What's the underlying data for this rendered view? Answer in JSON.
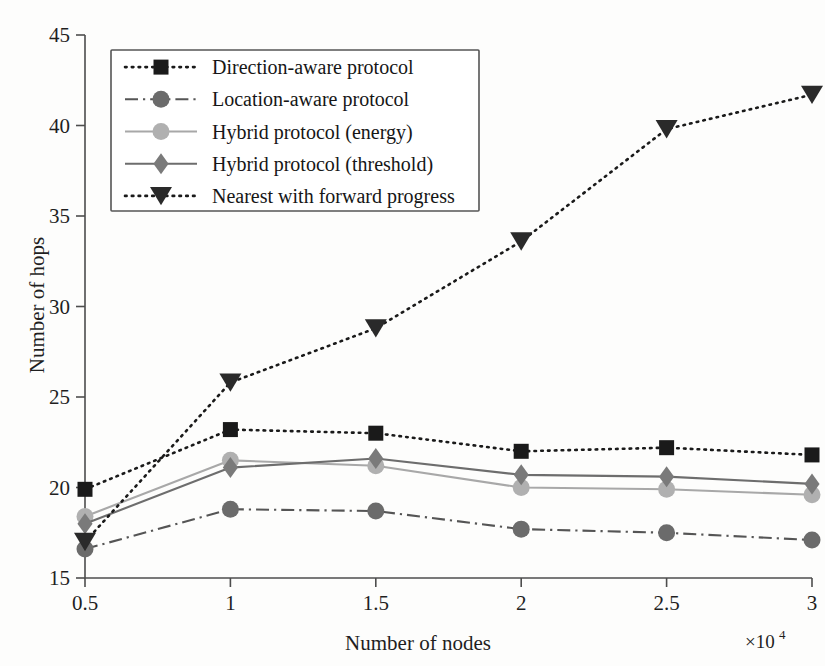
{
  "chart_data": {
    "type": "line",
    "title": "",
    "subtitle": "",
    "xlabel": "Number of nodes",
    "ylabel": "Number of hops",
    "x_multiplier": "×10⁴",
    "x_multiplier_base": "×10",
    "x_multiplier_exp": "4",
    "x": [
      0.5,
      1,
      1.5,
      2,
      2.5,
      3
    ],
    "xticklabels": [
      "0.5",
      "1",
      "1.5",
      "2",
      "2.5",
      "3"
    ],
    "yticks": [
      15,
      20,
      25,
      30,
      35,
      40,
      45
    ],
    "yticklabels": [
      "15",
      "20",
      "25",
      "30",
      "35",
      "40",
      "45"
    ],
    "xlim": [
      0.5,
      3.0
    ],
    "ylim": [
      15,
      45
    ],
    "grid": false,
    "legend_position": "upper-left",
    "series": [
      {
        "name": "Direction-aware protocol",
        "values": [
          19.9,
          23.2,
          23.0,
          22.0,
          22.2,
          21.8
        ],
        "marker": "square",
        "linestyle": "dotted",
        "color": "#1a1a1a",
        "marker_color": "#1a1a1a"
      },
      {
        "name": "Location-aware protocol",
        "values": [
          16.6,
          18.8,
          18.7,
          17.7,
          17.5,
          17.1
        ],
        "marker": "circle",
        "linestyle": "dashdot",
        "color": "#555555",
        "marker_color": "#6b6b6b"
      },
      {
        "name": "Hybrid protocol (energy)",
        "values": [
          18.4,
          21.5,
          21.2,
          20.0,
          19.9,
          19.6
        ],
        "marker": "circle",
        "linestyle": "solid",
        "color": "#a8a8a8",
        "marker_color": "#b0b0b0"
      },
      {
        "name": "Hybrid protocol (threshold)",
        "values": [
          18.0,
          21.1,
          21.6,
          20.7,
          20.6,
          20.2
        ],
        "marker": "diamond",
        "linestyle": "solid",
        "color": "#6d6d6d",
        "marker_color": "#7a7a7a"
      },
      {
        "name": "Nearest with forward progress",
        "values": [
          17.0,
          25.8,
          28.8,
          33.6,
          39.8,
          41.7
        ],
        "marker": "triangle-down",
        "linestyle": "dotted",
        "color": "#1a1a1a",
        "marker_color": "#2a2a2a"
      }
    ]
  }
}
